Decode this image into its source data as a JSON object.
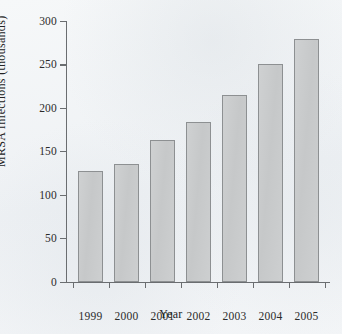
{
  "chart_data": {
    "type": "bar",
    "title": "",
    "xlabel": "Year",
    "ylabel": "MRSA Infections (thousands)",
    "categories": [
      "1999",
      "2000",
      "2001",
      "2002",
      "2003",
      "2004",
      "2005"
    ],
    "values": [
      127,
      135,
      163,
      184,
      215,
      251,
      279
    ],
    "ylim": [
      0,
      300
    ],
    "yticks": [
      0,
      50,
      100,
      150,
      200,
      250,
      300
    ],
    "ytick_labels": [
      "0",
      "50",
      "100",
      "150",
      "200",
      "250",
      "300"
    ],
    "grid": false,
    "legend": null,
    "series": [
      {
        "name": "MRSA Infections (thousands)",
        "values": [
          127,
          135,
          163,
          184,
          215,
          251,
          279
        ]
      }
    ],
    "bar_fill_color": "#c8caca",
    "bar_border_color": "#8d9092",
    "axis_color": "#6a6d70",
    "text_color": "#232323",
    "background_color": "#f1f4f6"
  }
}
